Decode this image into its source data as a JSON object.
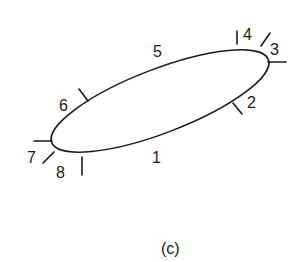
{
  "figure": {
    "caption": "(c)",
    "shape": "tilted ellipse with 8 numbered boundary markers",
    "labels": [
      {
        "id": "1",
        "text": "1"
      },
      {
        "id": "2",
        "text": "2"
      },
      {
        "id": "3",
        "text": "3"
      },
      {
        "id": "4",
        "text": "4"
      },
      {
        "id": "5",
        "text": "5"
      },
      {
        "id": "6",
        "text": "6"
      },
      {
        "id": "7",
        "text": "7"
      },
      {
        "id": "8",
        "text": "8"
      }
    ],
    "colors": {
      "line": "#1a1a1a",
      "background": "#ffffff"
    }
  }
}
